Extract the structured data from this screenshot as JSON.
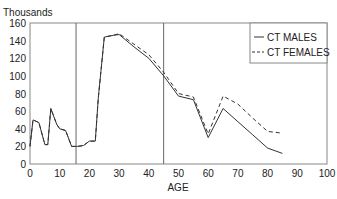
{
  "chart_data": {
    "type": "line",
    "title": "",
    "ylabel": "Thousands",
    "xlabel": "AGE",
    "xlim": [
      0,
      100
    ],
    "ylim": [
      0,
      160
    ],
    "xticks": [
      0,
      10,
      20,
      30,
      40,
      50,
      60,
      70,
      80,
      90,
      100
    ],
    "yticks": [
      0,
      20,
      40,
      60,
      80,
      100,
      120,
      140,
      160
    ],
    "grid": false,
    "legend_position": "upper right",
    "reference_lines_x": [
      15.5,
      45
    ],
    "series": [
      {
        "name": "CT MALES",
        "style": "solid",
        "x": [
          0,
          1,
          3,
          5,
          6,
          7,
          9,
          10,
          12,
          14,
          16,
          18,
          20,
          22,
          23,
          25,
          28,
          30,
          35,
          40,
          45,
          50,
          55,
          60,
          65,
          70,
          75,
          80,
          85
        ],
        "values": [
          20,
          50,
          47,
          22,
          22,
          63,
          45,
          40,
          38,
          20,
          20,
          21,
          26,
          26,
          75,
          144,
          146,
          147,
          133,
          120,
          100,
          77,
          73,
          30,
          63,
          48,
          33,
          18,
          12
        ]
      },
      {
        "name": "CT FEMALES",
        "style": "dashed",
        "x": [
          0,
          1,
          3,
          5,
          6,
          7,
          9,
          10,
          12,
          14,
          16,
          18,
          20,
          22,
          23,
          25,
          28,
          30,
          35,
          40,
          45,
          50,
          55,
          60,
          65,
          70,
          75,
          80,
          85
        ],
        "values": [
          20,
          50,
          47,
          22,
          22,
          63,
          45,
          40,
          38,
          20,
          20,
          21,
          26,
          26,
          75,
          144,
          146,
          148,
          136,
          124,
          104,
          80,
          76,
          34,
          77,
          68,
          52,
          37,
          35
        ]
      }
    ]
  }
}
